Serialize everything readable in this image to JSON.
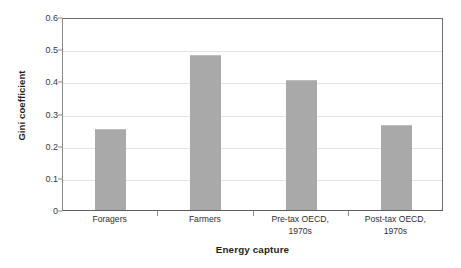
{
  "chart_data": {
    "type": "bar",
    "title": "",
    "xlabel": "Energy capture",
    "ylabel": "Gini coefficient",
    "categories": [
      "Foragers",
      "Farmers",
      "Pre-tax OECD, 1970s",
      "Post-tax OECD, 1970s"
    ],
    "category_lines": [
      [
        "Foragers"
      ],
      [
        "Farmers"
      ],
      [
        "Pre-tax OECD,",
        "1970s"
      ],
      [
        "Post-tax OECD,",
        "1970s"
      ]
    ],
    "values": [
      0.25,
      0.48,
      0.4,
      0.26
    ],
    "ylim": [
      0,
      0.6
    ],
    "ytick_values": [
      0,
      0.1,
      0.2,
      0.3,
      0.4,
      0.5,
      0.6
    ],
    "ytick_labels": [
      "0",
      "0.1",
      "0.2",
      "0.3",
      "0.4",
      "0.5",
      "0.6"
    ],
    "grid": true,
    "legend": false,
    "bar_color": "#a9a9a9",
    "axis_color": "#6f6f6f",
    "grid_color": "#e4e4e4"
  }
}
